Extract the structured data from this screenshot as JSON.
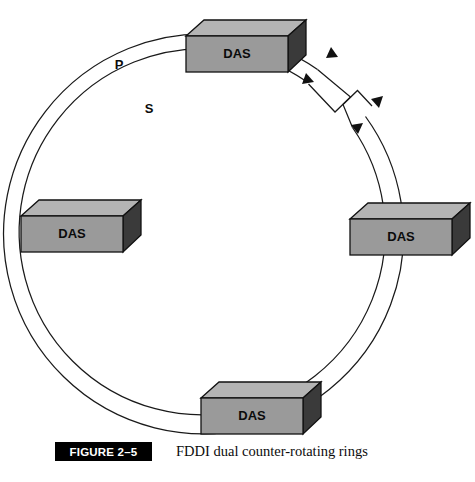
{
  "figure": {
    "tag": "FIGURE 2–5",
    "caption": "FDDI dual counter-rotating rings"
  },
  "diagram": {
    "type": "network-topology",
    "topology": "FDDI dual counter-rotating ring",
    "nodes": [
      {
        "id": "das-top",
        "label": "DAS",
        "position": "top",
        "cx": 240,
        "cy": 52
      },
      {
        "id": "das-right",
        "label": "DAS",
        "position": "right",
        "cx": 400,
        "cy": 235
      },
      {
        "id": "das-bottom",
        "label": "DAS",
        "position": "bottom",
        "cx": 252,
        "cy": 415
      },
      {
        "id": "das-left",
        "label": "DAS",
        "position": "left",
        "cx": 72,
        "cy": 232
      }
    ],
    "rings": [
      {
        "id": "primary",
        "label": "P",
        "label_x": 119,
        "label_y": 66,
        "direction": "counter-clockwise",
        "radius": 200
      },
      {
        "id": "secondary",
        "label": "S",
        "label_x": 149,
        "label_y": 110,
        "direction": "clockwise",
        "radius": 183
      }
    ],
    "arrow_count": 4,
    "break_position": "upper-right",
    "colors": {
      "node_front": "#9a9a9a",
      "node_top": "#b4b4b4",
      "node_side": "#3a3a3a",
      "line": "#1a1a1a",
      "text": "#0b0b0b",
      "tag_background": "#000000",
      "tag_text": "#ffffff",
      "page_background": "#ffffff"
    }
  }
}
